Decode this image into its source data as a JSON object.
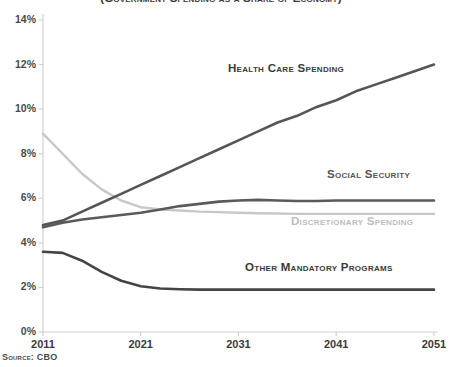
{
  "source_note": "Source: CBO",
  "chart_data": {
    "type": "line",
    "title": "(Government Spending as a Share of Economy)",
    "xlabel": "",
    "ylabel": "",
    "xlim": [
      2011,
      2051
    ],
    "ylim": [
      0,
      14
    ],
    "grid": false,
    "legend_position": "inline-labels",
    "x_ticks": [
      "2011",
      "2021",
      "2031",
      "2041",
      "2051"
    ],
    "y_ticks": [
      "0%",
      "2%",
      "4%",
      "6%",
      "8%",
      "10%",
      "12%",
      "14%"
    ],
    "x": [
      2011,
      2013,
      2015,
      2017,
      2019,
      2021,
      2023,
      2025,
      2027,
      2029,
      2031,
      2033,
      2035,
      2037,
      2039,
      2041,
      2043,
      2045,
      2047,
      2049,
      2051
    ],
    "series": [
      {
        "name": "Health Care Spending",
        "color": "#555555",
        "width": 2.6,
        "label_color": "#3a3a3a",
        "values": [
          4.8,
          5.0,
          5.4,
          5.8,
          6.2,
          6.6,
          7.0,
          7.4,
          7.8,
          8.2,
          8.6,
          9.0,
          9.4,
          9.7,
          10.1,
          10.4,
          10.8,
          11.1,
          11.4,
          11.7,
          12.0
        ]
      },
      {
        "name": "Social Security",
        "color": "#5a5a5a",
        "width": 2.6,
        "label_color": "#555555",
        "values": [
          4.7,
          4.9,
          5.05,
          5.15,
          5.25,
          5.35,
          5.5,
          5.65,
          5.75,
          5.85,
          5.9,
          5.93,
          5.9,
          5.88,
          5.88,
          5.9,
          5.9,
          5.9,
          5.9,
          5.9,
          5.9
        ]
      },
      {
        "name": "Discretionary Spending",
        "color": "#c8c8c8",
        "width": 2.4,
        "label_color": "#bdbdbd",
        "values": [
          8.9,
          8.0,
          7.1,
          6.4,
          5.9,
          5.6,
          5.5,
          5.45,
          5.4,
          5.38,
          5.35,
          5.33,
          5.32,
          5.3,
          5.3,
          5.3,
          5.3,
          5.3,
          5.3,
          5.3,
          5.3
        ]
      },
      {
        "name": "Other Mandatory Programs",
        "color": "#444444",
        "width": 2.6,
        "label_color": "#3a3a3a",
        "values": [
          3.6,
          3.55,
          3.2,
          2.7,
          2.3,
          2.05,
          1.95,
          1.92,
          1.9,
          1.9,
          1.9,
          1.9,
          1.9,
          1.9,
          1.9,
          1.9,
          1.9,
          1.9,
          1.9,
          1.9,
          1.9
        ]
      }
    ],
    "series_label_positions": [
      {
        "name": "Health Care Spending",
        "left": 228,
        "top": 62
      },
      {
        "name": "Social Security",
        "left": 327,
        "top": 168
      },
      {
        "name": "Discretionary Spending",
        "left": 291,
        "top": 215
      },
      {
        "name": "Other Mandatory Programs",
        "left": 245,
        "top": 261
      }
    ]
  }
}
